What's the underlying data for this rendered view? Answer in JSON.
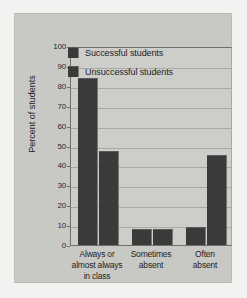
{
  "chart_data": {
    "type": "bar",
    "title": "",
    "xlabel": "",
    "ylabel": "Percent of students",
    "ylim": [
      0,
      100
    ],
    "yticks": [
      100,
      90,
      80,
      70,
      60,
      50,
      40,
      30,
      20,
      10,
      0
    ],
    "grid": true,
    "legend_position": "inside-upper-center",
    "categories": [
      "Always or almost always in class",
      "Sometimes absent",
      "Often absent"
    ],
    "category_lines": [
      [
        "Always or",
        "almost always",
        "in class"
      ],
      [
        "Sometimes",
        "absent",
        ""
      ],
      [
        "Often",
        "absent",
        ""
      ]
    ],
    "series": [
      {
        "name": "Successful students",
        "values": [
          84,
          8,
          9
        ],
        "color": "#3a3a3a"
      },
      {
        "name": "Unsuccessful students",
        "values": [
          47,
          8,
          45
        ],
        "color": "#3a3a3a"
      }
    ]
  },
  "axis": {
    "y_title": "Percent of students",
    "tick_labels": [
      "100",
      "90",
      "80",
      "70",
      "60",
      "50",
      "40",
      "30",
      "20",
      "10",
      "0"
    ]
  },
  "legend": {
    "items": [
      {
        "label": "Successful students"
      },
      {
        "label": "Unsuccessful students"
      }
    ]
  },
  "colors": {
    "page_background": "#f2f2f0",
    "panel_background": "#c8c8c4",
    "plot_background": "#cdcdc9",
    "bar": "#3a3a3a",
    "gridline": "#a9a9a5",
    "axis": "#6e6e6a",
    "text": "#1f1f1f"
  }
}
